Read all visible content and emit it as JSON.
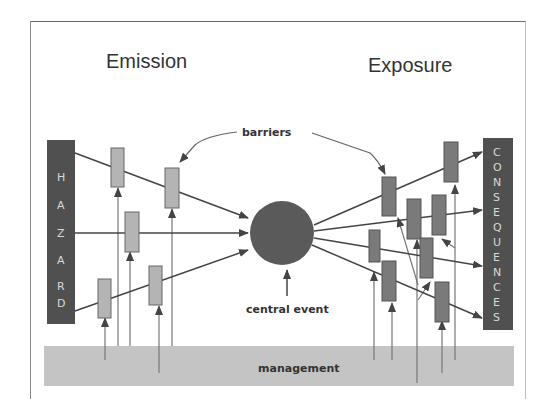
{
  "diagram": {
    "titles": {
      "left": "Emission",
      "right": "Exposure"
    },
    "labels": {
      "barriers": "barriers",
      "central_event": "central event",
      "management": "management"
    },
    "hazard": {
      "letters": [
        "H",
        "A",
        "Z",
        "A",
        "R",
        "D"
      ]
    },
    "consequences": {
      "letters": [
        "C",
        "O",
        "N",
        "S",
        "E",
        "Q",
        "U",
        "E",
        "N",
        "C",
        "E",
        "S"
      ]
    },
    "colors": {
      "dark_box": "#505050",
      "left_barrier": "#b4b4b4",
      "right_barrier": "#7a7a7a",
      "circle": "#5a5a5a",
      "management_band": "#c4c4c4",
      "line": "#555555"
    },
    "nodes": [
      "HAZARD",
      "central event",
      "CONSEQUENCES",
      "management"
    ],
    "left_barrier_count": 6,
    "right_barrier_count": 8
  }
}
